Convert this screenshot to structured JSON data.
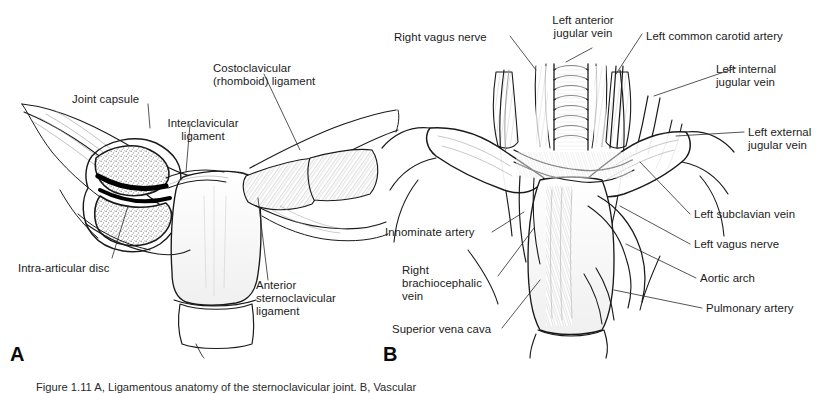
{
  "figure": {
    "type": "two-panel anatomical line drawing",
    "background_color": "#ffffff",
    "ink_color": "#1a1a1a",
    "caption_partial": "Figure 1.11  A, Ligamentous anatomy of the sternoclavicular joint. B, Vascular"
  },
  "panels": [
    {
      "id": "A",
      "letter": "A",
      "title": "Sternoclavicular joint ligaments",
      "labels": [
        {
          "key": "joint_capsule",
          "text": "Joint capsule"
        },
        {
          "key": "costoclavicular_ligament",
          "text": "Costoclavicular\n(rhomboid) ligament"
        },
        {
          "key": "interclavicular_ligament",
          "text": "Interclavicular\nligament"
        },
        {
          "key": "intra_articular_disc",
          "text": "Intra-articular disc"
        },
        {
          "key": "anterior_sc_ligament",
          "text": "Anterior\nsternoclavicular\nligament"
        }
      ]
    },
    {
      "id": "B",
      "letter": "B",
      "title": "Mediastinal vascular anatomy",
      "labels": [
        {
          "key": "right_vagus_nerve",
          "text": "Right vagus nerve"
        },
        {
          "key": "left_anterior_jugular_vein",
          "text": "Left anterior\njugular vein"
        },
        {
          "key": "left_common_carotid_artery",
          "text": "Left common carotid artery"
        },
        {
          "key": "left_internal_jugular_vein",
          "text": "Left internal\njugular vein"
        },
        {
          "key": "left_external_jugular_vein",
          "text": "Left external\njugular vein"
        },
        {
          "key": "left_subclavian_vein",
          "text": "Left subclavian vein"
        },
        {
          "key": "left_vagus_nerve",
          "text": "Left vagus nerve"
        },
        {
          "key": "aortic_arch",
          "text": "Aortic arch"
        },
        {
          "key": "pulmonary_artery",
          "text": "Pulmonary artery"
        },
        {
          "key": "innominate_artery",
          "text": "Innominate artery"
        },
        {
          "key": "right_brachiocephalic_vein",
          "text": "Right\nbrachiocephalic\nvein"
        },
        {
          "key": "superior_vena_cava",
          "text": "Superior vena cava"
        }
      ]
    }
  ]
}
